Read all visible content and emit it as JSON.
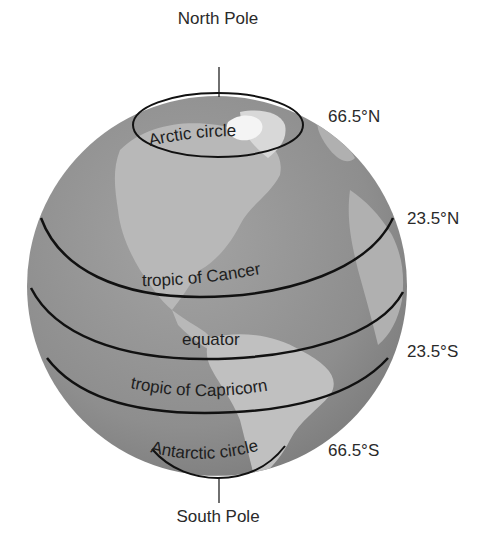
{
  "poles": {
    "north": "North Pole",
    "south": "South Pole"
  },
  "circles": [
    {
      "id": "arctic",
      "name": "Arctic circle",
      "latitude": "66.5°N"
    },
    {
      "id": "cancer",
      "name": "tropic of Cancer",
      "latitude": "23.5°N"
    },
    {
      "id": "equator",
      "name": "equator",
      "latitude": ""
    },
    {
      "id": "capricorn",
      "name": "tropic of Capricorn",
      "latitude": "23.5°S"
    },
    {
      "id": "antarctic",
      "name": "Antarctic circle",
      "latitude": "66.5°S"
    }
  ],
  "colors": {
    "ocean": "#8c8c8c",
    "land": "#b4b4b4",
    "ice": "#f2f2f2",
    "lines": "#111111",
    "text": "#2a2a2a"
  }
}
